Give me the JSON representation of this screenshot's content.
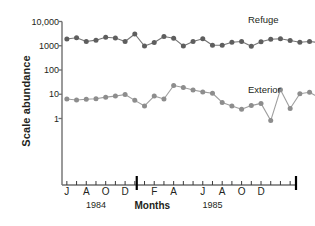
{
  "chart_data": {
    "type": "line",
    "title": "",
    "xlabel": "Months",
    "ylabel": "Scale abundance",
    "yscale": "log",
    "ylim": [
      0.3,
      10000
    ],
    "grid": false,
    "legend_position": "inline-right",
    "y_ticks": [
      {
        "value": 10000,
        "label": "10,000"
      },
      {
        "value": 1000,
        "label": "1000"
      },
      {
        "value": 100,
        "label": "100"
      },
      {
        "value": 10,
        "label": "10"
      },
      {
        "value": 1,
        "label": "1"
      }
    ],
    "x_tick_count": 24,
    "x_tick_labels": [
      {
        "index": 0,
        "label": "J"
      },
      {
        "index": 2,
        "label": "A"
      },
      {
        "index": 4,
        "label": "O"
      },
      {
        "index": 6,
        "label": "D"
      },
      {
        "index": 9,
        "label": "F"
      },
      {
        "index": 11,
        "label": "A"
      },
      {
        "index": 14,
        "label": "J"
      },
      {
        "index": 16,
        "label": "A"
      },
      {
        "index": 18,
        "label": "O"
      },
      {
        "index": 20,
        "label": "D"
      }
    ],
    "year_annotations": [
      {
        "label": "1984",
        "index": 3
      },
      {
        "label": "1985",
        "index": 15
      }
    ],
    "year_divider_index": 7.2,
    "series": [
      {
        "name": "Refuge",
        "color": "#5e5e5e",
        "values": [
          1900,
          2150,
          1500,
          1700,
          2250,
          2100,
          1500,
          3050,
          970,
          1350,
          2400,
          2050,
          980,
          1500,
          1950,
          1050,
          1050,
          1400,
          1500,
          950,
          1450,
          1850,
          1950,
          1650
        ]
      },
      {
        "name": "Exterior",
        "color": "#8d8d8d",
        "values": [
          6.4,
          5.8,
          6.2,
          6.5,
          7.6,
          8.4,
          9.8,
          5.6,
          3.3,
          8.4,
          6.4,
          23,
          19,
          15,
          12.5,
          11,
          4.6,
          3.3,
          2.4,
          3.4,
          4.2,
          0.82,
          15.5,
          2.6
        ]
      }
    ],
    "series2_extra": {
      "name": "Exterior",
      "values_tail": [
        10.5,
        12,
        7.1,
        6.8,
        6.9,
        6.3,
        9.5,
        13,
        16,
        20,
        26,
        27,
        25.5,
        14.5,
        4.6
      ]
    },
    "series1_extra": {
      "name": "Refuge",
      "values_tail": [
        1400,
        1500,
        1350,
        1750,
        2100,
        2600,
        2050,
        1800,
        1750,
        1750,
        1300
      ]
    },
    "labels": {
      "refuge": "Refuge",
      "exterior": "Exterior"
    }
  },
  "axis": {
    "y_title": "Scale abundance",
    "x_title": "Months",
    "year_left": "1984",
    "year_right": "1985"
  }
}
